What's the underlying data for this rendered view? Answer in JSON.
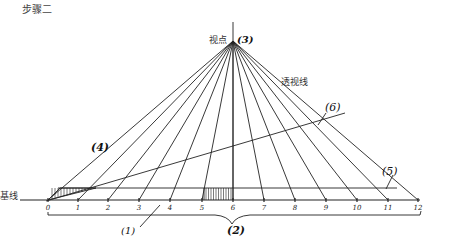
{
  "title": "步骤二",
  "labels": {
    "vanishing_point": "视点",
    "vanishing_point_num": "(3)",
    "perspective_line": "透视线",
    "base_line": "基线",
    "marker_1": "(1)",
    "marker_2": "(2)",
    "marker_4": "(4)",
    "marker_5": "(5)",
    "marker_6": "(6)"
  },
  "ticks": [
    "0",
    "1",
    "2",
    "3",
    "4",
    "5",
    "6",
    "7",
    "8",
    "9",
    "10",
    "11",
    "12"
  ],
  "geometry": {
    "vanishing_point": [
      233,
      41
    ],
    "base_y": 200,
    "parallel_y": 188,
    "tick_x": [
      48,
      78,
      108,
      139,
      170,
      202,
      233,
      264,
      295,
      326,
      357,
      388,
      418
    ]
  },
  "colors": {
    "line": "#222222",
    "text": "#333333",
    "background": "#ffffff"
  }
}
